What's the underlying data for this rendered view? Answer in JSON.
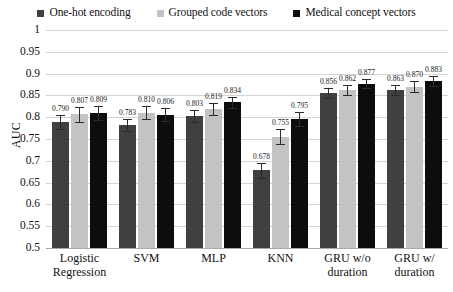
{
  "chart_data": {
    "type": "bar",
    "title": "",
    "xlabel": "",
    "ylabel": "AUC",
    "ylim": [
      0.5,
      1
    ],
    "ytick_labels": [
      "1",
      "0.95",
      "0.9",
      "0.85",
      "0.8",
      "0.75",
      "0.7",
      "0.65",
      "0.6",
      "0.55",
      "0.5"
    ],
    "ytick_values": [
      1,
      0.95,
      0.9,
      0.85,
      0.8,
      0.75,
      0.7,
      0.65,
      0.6,
      0.55,
      0.5
    ],
    "grid": true,
    "legend_position": "top-center",
    "categories": [
      "Logistic Regression",
      "SVM",
      "MLP",
      "KNN",
      "GRU w/o duration",
      "GRU w/ duration"
    ],
    "series": [
      {
        "name": "One-hot encoding",
        "color": "#404040",
        "values": [
          0.79,
          0.783,
          0.803,
          0.678,
          0.856,
          0.863
        ],
        "labels": [
          "0.790",
          "0.783",
          "0.803",
          "0.678",
          "0.856",
          "0.863"
        ],
        "errors": [
          0.016,
          0.014,
          0.013,
          0.018,
          0.012,
          0.011
        ]
      },
      {
        "name": "Grouped code vectors",
        "color": "#c3c3c3",
        "values": [
          0.807,
          0.81,
          0.819,
          0.755,
          0.862,
          0.87
        ],
        "labels": [
          "0.807",
          "0.810",
          "0.819",
          "0.755",
          "0.862",
          "0.870"
        ],
        "errors": [
          0.017,
          0.015,
          0.014,
          0.017,
          0.012,
          0.012
        ]
      },
      {
        "name": "Medical concept vectors",
        "color": "#0d0d0d",
        "values": [
          0.809,
          0.806,
          0.834,
          0.795,
          0.877,
          0.883
        ],
        "labels": [
          "0.809",
          "0.806",
          "0.834",
          "0.795",
          "0.877",
          "0.883"
        ],
        "errors": [
          0.016,
          0.014,
          0.013,
          0.016,
          0.011,
          0.011
        ]
      }
    ]
  },
  "legend": {
    "items": [
      {
        "label": "One-hot encoding",
        "color": "#404040"
      },
      {
        "label": "Grouped code vectors",
        "color": "#c3c3c3"
      },
      {
        "label": "Medical concept vectors",
        "color": "#0d0d0d"
      }
    ]
  },
  "axis": {
    "y_title": "AUC"
  }
}
